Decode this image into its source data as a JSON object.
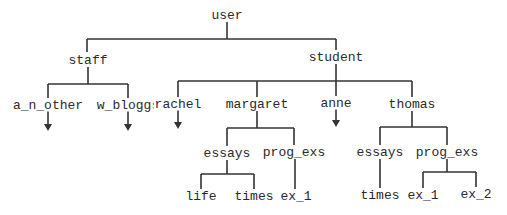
{
  "diagram": {
    "type": "tree",
    "line_color": "#333333",
    "text_color": "#2a2a2a",
    "nodes": {
      "user": {
        "label": "user",
        "x": 227,
        "y": 15
      },
      "staff": {
        "label": "staff",
        "x": 88,
        "y": 60
      },
      "student": {
        "label": "student",
        "x": 336,
        "y": 57
      },
      "a_n_other": {
        "label": "a_n_other",
        "x": 48,
        "y": 105
      },
      "w_bloggs": {
        "label": "w_bloggs",
        "x": 128,
        "y": 105
      },
      "rachel": {
        "label": "rachel",
        "x": 178,
        "y": 104
      },
      "margaret": {
        "label": "margaret",
        "x": 257,
        "y": 104
      },
      "anne": {
        "label": "anne",
        "x": 336,
        "y": 103
      },
      "thomas": {
        "label": "thomas",
        "x": 412,
        "y": 104
      },
      "m_essays": {
        "label": "essays",
        "x": 227,
        "y": 153
      },
      "m_prog_exs": {
        "label": "prog_exs",
        "x": 294,
        "y": 152
      },
      "m_life": {
        "label": "life",
        "x": 201,
        "y": 196
      },
      "m_times": {
        "label": "times",
        "x": 254,
        "y": 196
      },
      "m_ex_1": {
        "label": "ex_1",
        "x": 296,
        "y": 196
      },
      "t_essays": {
        "label": "essays",
        "x": 380,
        "y": 152
      },
      "t_prog_exs": {
        "label": "prog_exs",
        "x": 447,
        "y": 152
      },
      "t_times": {
        "label": "times",
        "x": 380,
        "y": 195
      },
      "t_ex_1": {
        "label": "ex_1",
        "x": 423,
        "y": 195
      },
      "t_ex_2": {
        "label": "ex_2",
        "x": 476,
        "y": 194
      }
    },
    "edges": [
      [
        "user",
        "staff"
      ],
      [
        "user",
        "student"
      ],
      [
        "staff",
        "a_n_other"
      ],
      [
        "staff",
        "w_bloggs"
      ],
      [
        "student",
        "rachel"
      ],
      [
        "student",
        "margaret"
      ],
      [
        "student",
        "anne"
      ],
      [
        "student",
        "thomas"
      ],
      [
        "margaret",
        "m_essays"
      ],
      [
        "margaret",
        "m_prog_exs"
      ],
      [
        "m_essays",
        "m_life"
      ],
      [
        "m_essays",
        "m_times"
      ],
      [
        "m_prog_exs",
        "m_ex_1"
      ],
      [
        "thomas",
        "t_essays"
      ],
      [
        "thomas",
        "t_prog_exs"
      ],
      [
        "t_essays",
        "t_times"
      ],
      [
        "t_prog_exs",
        "t_ex_1"
      ],
      [
        "t_prog_exs",
        "t_ex_2"
      ]
    ],
    "arrows_from": [
      "a_n_other",
      "w_bloggs",
      "rachel",
      "anne"
    ]
  }
}
